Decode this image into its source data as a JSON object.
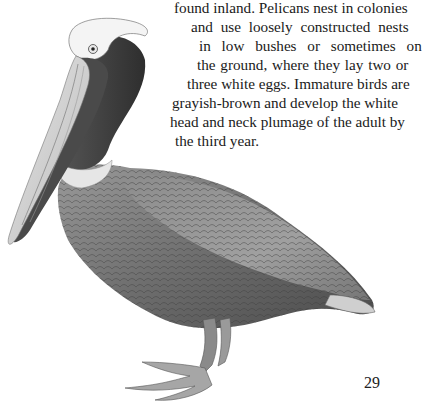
{
  "page": {
    "paragraph_lines": [
      "found inland. Pelicans nest in colonies",
      "and use loosely constructed nests",
      "in low bushes or sometimes on",
      "the ground, where they lay two or",
      "three white eggs. Immature birds are",
      "grayish-brown and develop the white",
      "head and neck plumage of the adult by",
      "the third year."
    ],
    "illustration": "brown-pelican-illustration",
    "page_number": "29"
  }
}
